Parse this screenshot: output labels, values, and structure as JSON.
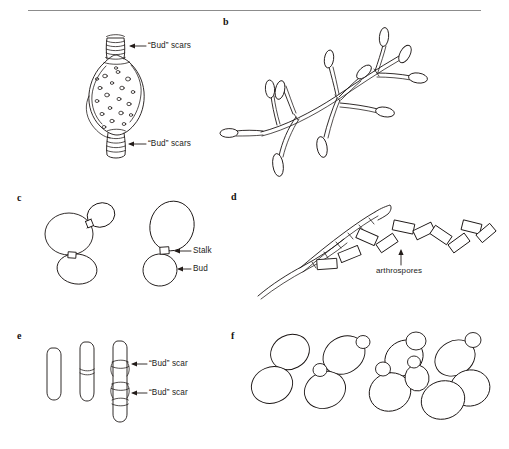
{
  "figure": {
    "rule_color": "#8c8c8c",
    "ink_color": "#1a1413",
    "background": "#ffffff"
  },
  "panels": [
    {
      "id": "a",
      "letter": "",
      "name": "lemon-shaped-cell-with-bud-scars",
      "labels": [
        {
          "text": "“Bud” scars",
          "target": "apical-scar-collar"
        },
        {
          "text": "“Bud” scars",
          "target": "basal-scar-collar"
        }
      ]
    },
    {
      "id": "b",
      "letter": "b",
      "name": "branching-pseudohyphae-with-blastoconidia",
      "labels": []
    },
    {
      "id": "c",
      "letter": "c",
      "name": "budding-yeast-cells",
      "labels": [
        {
          "text": "Stalk",
          "target": "bud-stalk"
        },
        {
          "text": "Bud",
          "target": "daughter-bud"
        }
      ]
    },
    {
      "id": "d",
      "letter": "d",
      "name": "hypha-fragmenting-into-arthrospores",
      "labels": [
        {
          "text": "arthrospores",
          "target": "arthrospore-chain"
        }
      ]
    },
    {
      "id": "e",
      "letter": "e",
      "name": "elongate-cells-with-annular-bud-scars",
      "labels": [
        {
          "text": "“Bud” scar",
          "target": "upper-annular-scar"
        },
        {
          "text": "“Bud” scar",
          "target": "lower-annular-scar"
        }
      ]
    },
    {
      "id": "f",
      "letter": "f",
      "name": "yeast-cell-clusters",
      "labels": []
    }
  ]
}
